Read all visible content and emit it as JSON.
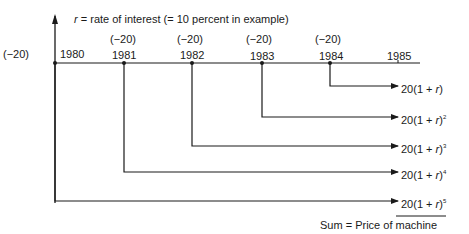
{
  "header": {
    "rate_var": "r",
    "rate_text": "= rate of interest (= 10 percent in example)"
  },
  "timeline": {
    "years": [
      "1980",
      "1981",
      "1982",
      "1983",
      "1984",
      "1985"
    ],
    "payments": [
      "(−20)",
      "(−20)",
      "(−20)",
      "(−20)",
      "(−20)"
    ]
  },
  "future_values": [
    {
      "prefix": "20(1 + ",
      "var": "r",
      "suffix": ")",
      "exp": ""
    },
    {
      "prefix": "20(1 + ",
      "var": "r",
      "suffix": ")",
      "exp": "2"
    },
    {
      "prefix": "20(1 + ",
      "var": "r",
      "suffix": ")",
      "exp": "3"
    },
    {
      "prefix": "20(1 + ",
      "var": "r",
      "suffix": ")",
      "exp": "4"
    },
    {
      "prefix": "20(1 + ",
      "var": "r",
      "suffix": ")",
      "exp": "5"
    }
  ],
  "sum_label": "Sum = Price of machine"
}
